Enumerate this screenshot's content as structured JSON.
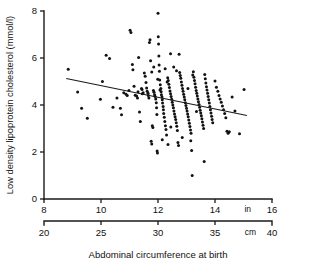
{
  "chart_data": {
    "type": "scatter",
    "title": "",
    "xlabel": "Abdominal circumference at birth",
    "ylabel": "Low density lipoprotein cholesterol (mmol/l)",
    "grid": false,
    "legend": null,
    "axes": {
      "y": {
        "label": "Low density lipoprotein cholesterol (mmol/l)",
        "ticks": [
          0,
          2,
          4,
          6,
          8
        ],
        "tick_labels": [
          "0",
          "2",
          "4",
          "6",
          "8"
        ],
        "lim": [
          0,
          8
        ]
      },
      "x_primary": {
        "unit": "in",
        "unit_label": "in",
        "ticks": [
          8,
          10,
          12,
          14,
          16
        ],
        "tick_labels": [
          "8",
          "10",
          "12",
          "14",
          "16"
        ],
        "lim": [
          8,
          16
        ]
      },
      "x_secondary": {
        "unit": "cm",
        "unit_label": "cm",
        "ticks": [
          20,
          25,
          30,
          35,
          40
        ],
        "tick_labels": [
          "20",
          "25",
          "30",
          "35",
          "40"
        ],
        "lim": [
          20,
          40
        ]
      }
    },
    "regression_line": {
      "x_start_in": 8.78,
      "y_start": 5.13,
      "x_end_in": 15.12,
      "y_end": 3.55
    },
    "points": [
      [
        8.85,
        5.52
      ],
      [
        9.18,
        4.55
      ],
      [
        9.32,
        3.86
      ],
      [
        9.52,
        3.44
      ],
      [
        9.98,
        4.24
      ],
      [
        10.05,
        5.0
      ],
      [
        10.18,
        6.12
      ],
      [
        10.3,
        5.98
      ],
      [
        10.42,
        3.9
      ],
      [
        10.56,
        4.3
      ],
      [
        10.68,
        3.86
      ],
      [
        10.72,
        3.58
      ],
      [
        10.8,
        4.52
      ],
      [
        10.88,
        4.46
      ],
      [
        10.92,
        4.4
      ],
      [
        10.98,
        4.62
      ],
      [
        11.02,
        7.18
      ],
      [
        11.05,
        7.08
      ],
      [
        11.1,
        5.72
      ],
      [
        11.12,
        5.5
      ],
      [
        11.16,
        4.8
      ],
      [
        11.2,
        4.42
      ],
      [
        11.25,
        4.38
      ],
      [
        11.28,
        4.3
      ],
      [
        11.32,
        6.02
      ],
      [
        11.35,
        3.7
      ],
      [
        11.38,
        3.3
      ],
      [
        11.42,
        4.7
      ],
      [
        11.45,
        4.48
      ],
      [
        11.48,
        4.52
      ],
      [
        11.52,
        5.36
      ],
      [
        11.55,
        5.22
      ],
      [
        11.58,
        4.96
      ],
      [
        11.6,
        4.72
      ],
      [
        11.62,
        4.58
      ],
      [
        11.65,
        4.5
      ],
      [
        11.66,
        4.4
      ],
      [
        11.68,
        4.3
      ],
      [
        11.7,
        6.66
      ],
      [
        11.72,
        6.78
      ],
      [
        11.74,
        5.88
      ],
      [
        11.76,
        2.46
      ],
      [
        11.78,
        2.34
      ],
      [
        11.8,
        3.12
      ],
      [
        11.82,
        3.04
      ],
      [
        11.84,
        4.62
      ],
      [
        11.86,
        4.54
      ],
      [
        11.88,
        4.44
      ],
      [
        11.9,
        4.36
      ],
      [
        11.92,
        4.26
      ],
      [
        11.94,
        4.1
      ],
      [
        11.95,
        3.88
      ],
      [
        11.96,
        3.6
      ],
      [
        11.97,
        2.04
      ],
      [
        11.98,
        1.96
      ],
      [
        11.99,
        5.1
      ],
      [
        12.0,
        7.9
      ],
      [
        12.01,
        6.9
      ],
      [
        12.02,
        6.6
      ],
      [
        12.03,
        6.08
      ],
      [
        12.04,
        5.7
      ],
      [
        12.05,
        5.44
      ],
      [
        12.06,
        5.06
      ],
      [
        12.08,
        4.86
      ],
      [
        12.1,
        4.7
      ],
      [
        12.11,
        4.56
      ],
      [
        12.12,
        4.44
      ],
      [
        12.14,
        4.34
      ],
      [
        12.15,
        4.22
      ],
      [
        12.16,
        4.08
      ],
      [
        12.18,
        3.94
      ],
      [
        12.19,
        3.8
      ],
      [
        12.2,
        3.64
      ],
      [
        12.22,
        3.48
      ],
      [
        12.24,
        3.3
      ],
      [
        12.26,
        3.12
      ],
      [
        12.28,
        2.96
      ],
      [
        12.3,
        2.72
      ],
      [
        12.32,
        4.98
      ],
      [
        12.34,
        5.16
      ],
      [
        12.36,
        5.04
      ],
      [
        12.38,
        4.88
      ],
      [
        12.4,
        4.74
      ],
      [
        12.42,
        4.6
      ],
      [
        12.44,
        4.48
      ],
      [
        12.46,
        4.36
      ],
      [
        12.48,
        4.24
      ],
      [
        12.5,
        4.12
      ],
      [
        12.52,
        4.0
      ],
      [
        12.54,
        3.88
      ],
      [
        12.56,
        3.74
      ],
      [
        12.58,
        3.62
      ],
      [
        12.6,
        3.5
      ],
      [
        12.62,
        3.38
      ],
      [
        12.64,
        3.24
      ],
      [
        12.66,
        3.1
      ],
      [
        12.68,
        2.92
      ],
      [
        12.7,
        2.4
      ],
      [
        12.72,
        2.28
      ],
      [
        12.74,
        6.16
      ],
      [
        12.76,
        5.38
      ],
      [
        12.78,
        5.26
      ],
      [
        12.8,
        5.14
      ],
      [
        12.82,
        4.98
      ],
      [
        12.84,
        4.84
      ],
      [
        12.86,
        4.7
      ],
      [
        12.88,
        4.58
      ],
      [
        12.9,
        4.46
      ],
      [
        12.92,
        4.34
      ],
      [
        12.94,
        4.22
      ],
      [
        12.96,
        4.1
      ],
      [
        12.98,
        3.98
      ],
      [
        13.0,
        3.86
      ],
      [
        13.02,
        3.74
      ],
      [
        13.04,
        3.62
      ],
      [
        13.06,
        3.5
      ],
      [
        13.08,
        3.36
      ],
      [
        13.1,
        3.22
      ],
      [
        13.12,
        3.08
      ],
      [
        13.14,
        2.94
      ],
      [
        13.16,
        2.8
      ],
      [
        13.18,
        2.06
      ],
      [
        13.2,
        1.0
      ],
      [
        13.22,
        5.28
      ],
      [
        13.24,
        5.42
      ],
      [
        13.26,
        5.18
      ],
      [
        13.28,
        5.04
      ],
      [
        13.3,
        4.9
      ],
      [
        13.32,
        4.76
      ],
      [
        13.34,
        4.62
      ],
      [
        13.36,
        4.5
      ],
      [
        13.38,
        4.38
      ],
      [
        13.4,
        4.26
      ],
      [
        13.42,
        4.14
      ],
      [
        13.44,
        4.02
      ],
      [
        13.46,
        3.9
      ],
      [
        13.48,
        3.78
      ],
      [
        13.5,
        3.66
      ],
      [
        13.52,
        3.54
      ],
      [
        13.54,
        3.42
      ],
      [
        13.56,
        3.28
      ],
      [
        13.58,
        3.14
      ],
      [
        13.6,
        3.0
      ],
      [
        13.62,
        1.6
      ],
      [
        13.64,
        5.3
      ],
      [
        13.66,
        5.12
      ],
      [
        13.68,
        4.94
      ],
      [
        13.7,
        4.78
      ],
      [
        13.72,
        4.64
      ],
      [
        13.74,
        4.5
      ],
      [
        13.76,
        4.36
      ],
      [
        13.78,
        4.22
      ],
      [
        13.8,
        4.08
      ],
      [
        13.82,
        3.94
      ],
      [
        13.84,
        3.8
      ],
      [
        13.86,
        3.66
      ],
      [
        13.88,
        3.52
      ],
      [
        13.9,
        3.38
      ],
      [
        13.92,
        3.24
      ],
      [
        14.0,
        5.02
      ],
      [
        14.05,
        4.76
      ],
      [
        14.1,
        4.58
      ],
      [
        14.14,
        4.4
      ],
      [
        14.18,
        4.26
      ],
      [
        14.22,
        4.12
      ],
      [
        14.26,
        3.96
      ],
      [
        14.3,
        3.8
      ],
      [
        14.34,
        3.64
      ],
      [
        14.38,
        3.46
      ],
      [
        14.42,
        2.88
      ],
      [
        14.46,
        2.8
      ],
      [
        14.5,
        2.86
      ],
      [
        14.6,
        4.34
      ],
      [
        14.7,
        3.74
      ],
      [
        14.86,
        2.78
      ],
      [
        15.02,
        4.66
      ],
      [
        11.3,
        4.56
      ],
      [
        11.44,
        4.66
      ],
      [
        12.07,
        4.64
      ],
      [
        12.45,
        3.06
      ],
      [
        12.65,
        5.46
      ],
      [
        12.85,
        2.62
      ],
      [
        13.05,
        4.7
      ],
      [
        13.35,
        3.72
      ],
      [
        12.25,
        5.54
      ],
      [
        11.85,
        5.62
      ],
      [
        12.55,
        5.62
      ],
      [
        12.15,
        2.52
      ],
      [
        12.35,
        2.32
      ],
      [
        13.15,
        2.48
      ],
      [
        11.78,
        5.4
      ],
      [
        12.44,
        6.18
      ]
    ]
  }
}
